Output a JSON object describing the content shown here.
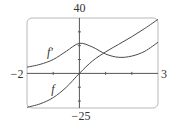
{
  "chart_data": {
    "type": "line",
    "title": "",
    "xlabel": "",
    "ylabel": "",
    "xlim": [
      -2,
      3
    ],
    "ylim": [
      -25,
      40
    ],
    "x_tick_labels": [
      "-2",
      "3"
    ],
    "y_tick_labels": [
      "40",
      "-25"
    ],
    "x_ticks": [
      -1,
      1,
      2
    ],
    "y_ticks": [
      -20,
      -10,
      10,
      20,
      30
    ],
    "grid": false,
    "legend": "inline labels",
    "series": [
      {
        "name": "f'",
        "label": "f′",
        "x": [
          -2,
          -1.5,
          -1,
          -0.5,
          0,
          0.5,
          1,
          1.5,
          2,
          2.5,
          3
        ],
        "values": [
          4.5,
          6.5,
          10,
          16,
          21.7,
          19,
          14,
          11.6,
          12.5,
          16,
          22.5
        ]
      },
      {
        "name": "f",
        "label": "f",
        "x": [
          -2,
          -1.5,
          -1,
          -0.5,
          0,
          0.5,
          1,
          1.5,
          2,
          2.5,
          3
        ],
        "values": [
          -24.5,
          -22,
          -17.5,
          -10,
          0,
          9,
          15.5,
          21,
          26.5,
          32.5,
          39
        ]
      }
    ]
  },
  "labels": {
    "y_max": "40",
    "y_min": "−25",
    "x_min": "−2",
    "x_max": "3",
    "fprime": "f′",
    "f": "f"
  }
}
